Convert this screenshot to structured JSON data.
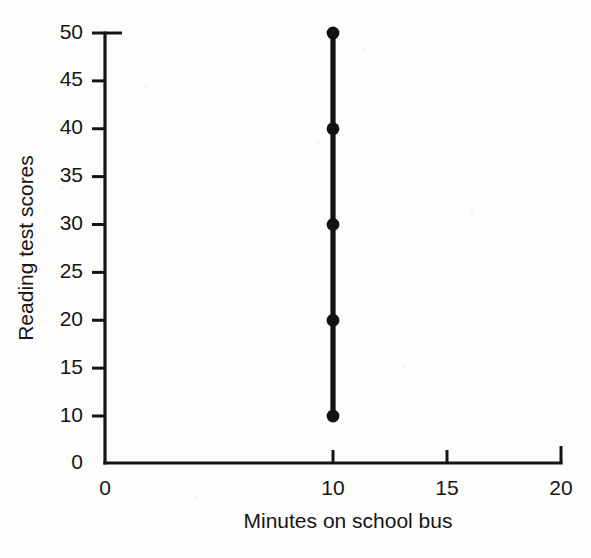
{
  "figure": {
    "background_color": "#fdfdfc",
    "ink_color": "#141414"
  },
  "chart_data": {
    "type": "scatter",
    "title": "",
    "subtitle": "",
    "xlabel": "Minutes on school bus",
    "ylabel": "Reading test scores",
    "xlim": [
      0,
      20
    ],
    "ylim": [
      0,
      50
    ],
    "x_ticks": [
      0,
      10,
      15,
      20
    ],
    "x_tick_labels": [
      "0",
      "10",
      "15",
      "20"
    ],
    "y_ticks": [
      0,
      10,
      15,
      20,
      25,
      30,
      35,
      40,
      45,
      50
    ],
    "y_tick_labels": [
      "0",
      "10",
      "15",
      "20",
      "25",
      "30",
      "35",
      "40",
      "45",
      "50"
    ],
    "grid": false,
    "legend": null,
    "legend_position": "none",
    "connected": true,
    "marker": "circle",
    "series": [
      {
        "name": "Reading test scores at 10 minutes",
        "color": "#121212",
        "x": [
          10,
          10,
          10,
          10,
          10
        ],
        "y": [
          10,
          20,
          30,
          40,
          50
        ]
      }
    ],
    "annotations": []
  },
  "axis_styling": {
    "y_tick_direction": "outward",
    "x_tick_direction": "inward",
    "spines": [
      "left",
      "bottom"
    ]
  }
}
